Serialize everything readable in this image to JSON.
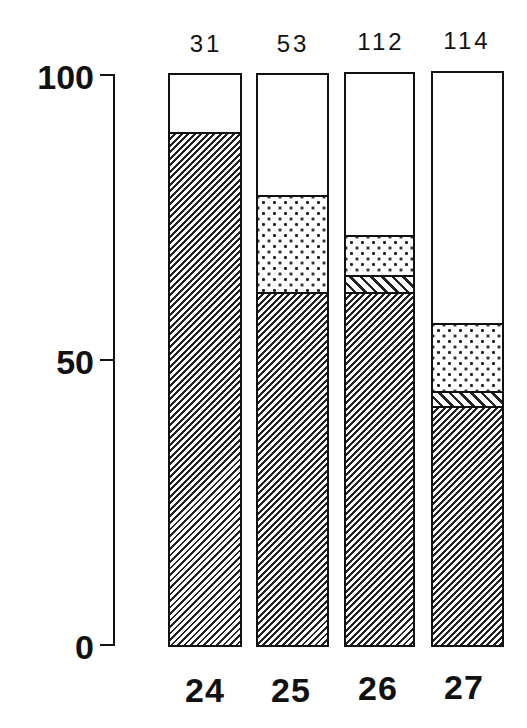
{
  "chart_data": {
    "type": "bar",
    "stacked": true,
    "title": "",
    "xlabel": "",
    "ylabel": "",
    "ylim": [
      0,
      100
    ],
    "yticks": [
      0,
      50,
      100
    ],
    "categories": [
      "24",
      "25",
      "26",
      "27"
    ],
    "counts_above_bars": [
      "31",
      "53",
      "112",
      "114"
    ],
    "series": [
      {
        "name": "diagonal hatch (////)",
        "pattern": "hatch",
        "values": [
          90,
          62,
          62,
          42
        ]
      },
      {
        "name": "reverse hatch (\\\\\\\\)",
        "pattern": "rhatch",
        "values": [
          0,
          0,
          3,
          2.5
        ]
      },
      {
        "name": "stippled (dots)",
        "pattern": "dots",
        "values": [
          0,
          17,
          7,
          12
        ]
      },
      {
        "name": "blank (white)",
        "pattern": "blank",
        "values": [
          10,
          21,
          28,
          43.5
        ]
      }
    ],
    "grid": false,
    "legend": null
  },
  "axis": {
    "ticks": [
      {
        "label": "100",
        "value": 100
      },
      {
        "label": "50",
        "value": 50
      },
      {
        "label": "0",
        "value": 0
      }
    ]
  },
  "bars": [
    {
      "label": "24",
      "count": "31"
    },
    {
      "label": "25",
      "count": "53"
    },
    {
      "label": "26",
      "count": "112"
    },
    {
      "label": "27",
      "count": "114"
    }
  ],
  "colors": {
    "ink": "#111111",
    "background": "#ffffff"
  }
}
